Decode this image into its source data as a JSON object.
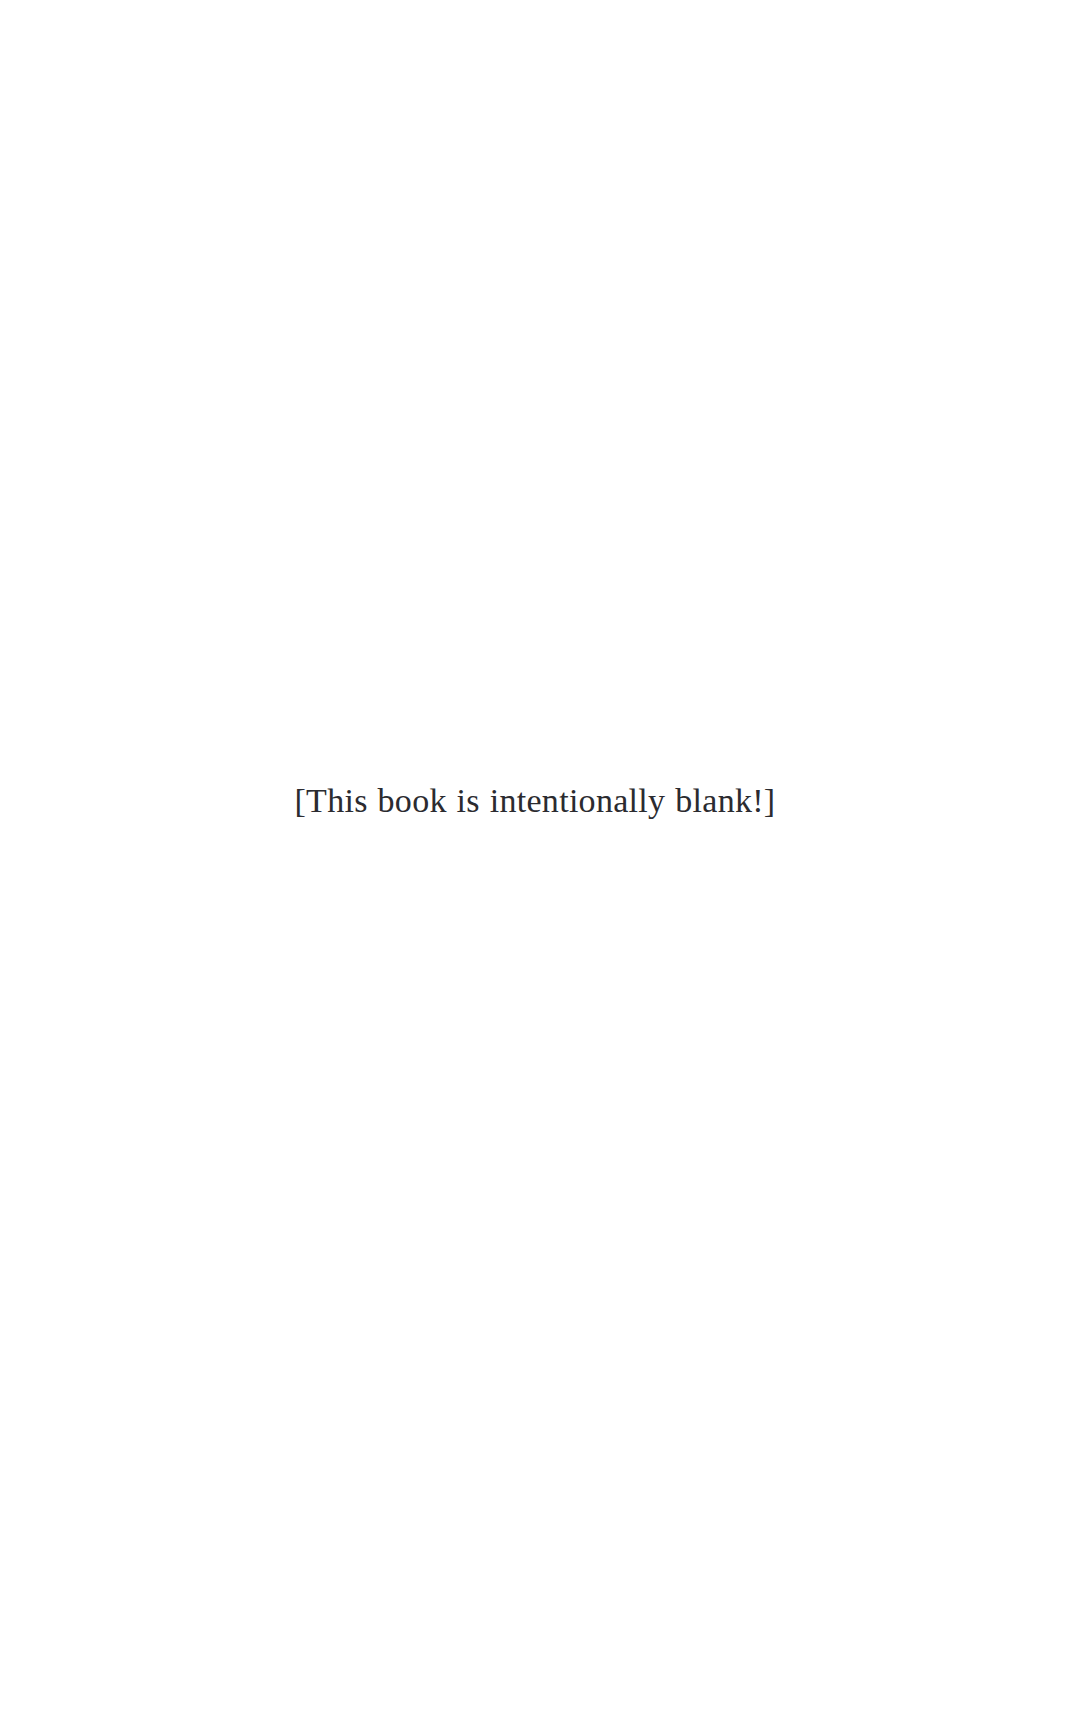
{
  "page": {
    "background_color": "#ffffff",
    "width": 1070,
    "height": 1723
  },
  "notice": {
    "text": "[This book is intentionally blank!]",
    "color": "#2b2b30",
    "font_size_px": 34,
    "alignment": "center"
  }
}
